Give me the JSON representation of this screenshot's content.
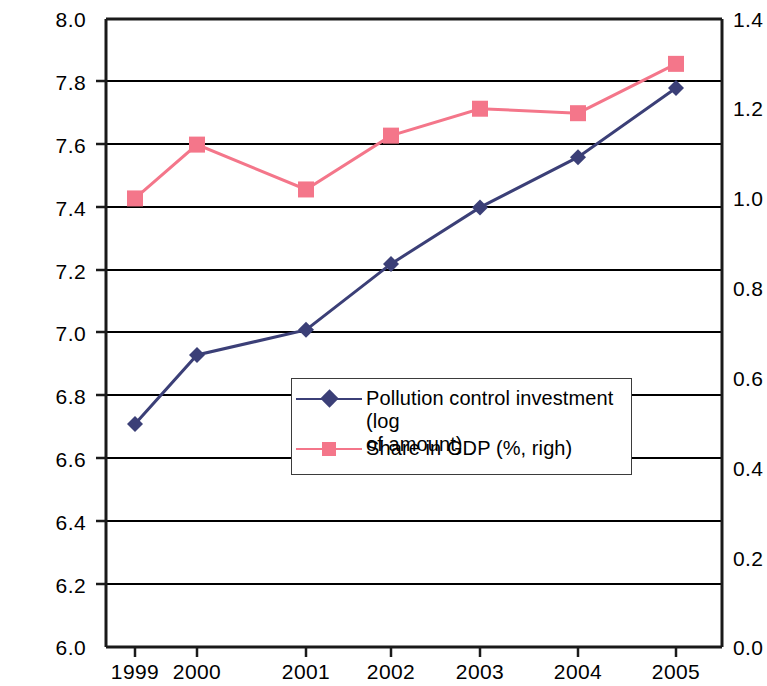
{
  "chart_data": {
    "type": "line",
    "title": "",
    "subtitle": "",
    "xlabel": "",
    "ylabel": "",
    "grid": true,
    "legend_position": "center",
    "categories": [
      "1999",
      "2000",
      "2001",
      "2002",
      "2003",
      "2004",
      "2005"
    ],
    "x_tick_labels": [
      "1999",
      "2000",
      "2001",
      "2002",
      "2003",
      "2004",
      "2005"
    ],
    "left_axis": {
      "label": "",
      "ylim": [
        6.0,
        8.0
      ],
      "tick_step": 0.2,
      "tick_labels": [
        "8.0",
        "7.8",
        "7.6",
        "7.4",
        "7.2",
        "7.0",
        "6.8",
        "6.6",
        "6.4",
        "6.2",
        "6.0"
      ]
    },
    "right_axis": {
      "label": "",
      "ylim": [
        0.0,
        1.4
      ],
      "tick_step": 0.2,
      "tick_labels": [
        "1.4",
        "1.2",
        "1.0",
        "0.8",
        "0.6",
        "0.4",
        "0.2",
        "0.0"
      ]
    },
    "series": [
      {
        "name": "Pollution control investment  (log of amount)",
        "axis": "left",
        "color": "#3b3f77",
        "marker": "diamond",
        "values": [
          6.71,
          6.93,
          7.01,
          7.22,
          7.4,
          7.56,
          7.78
        ]
      },
      {
        "name": "Share in GDP (%, righ)",
        "axis": "right",
        "color": "#f4768a",
        "marker": "square",
        "values": [
          1.0,
          1.12,
          1.02,
          1.14,
          1.2,
          1.19,
          1.3
        ]
      }
    ]
  },
  "legend": {
    "items": [
      {
        "label": "Pollution control investment  (log\nof amount)",
        "marker": "diamond-marker",
        "color": "#3b3f77"
      },
      {
        "label": "Share in GDP (%, righ)",
        "marker": "square-marker",
        "color": "#f4768a"
      }
    ]
  },
  "colors": {
    "series_blue": "#3b3f77",
    "series_pink": "#f4768a",
    "axis": "#1a1a1a",
    "gridline": "#000000",
    "background": "#ffffff"
  }
}
